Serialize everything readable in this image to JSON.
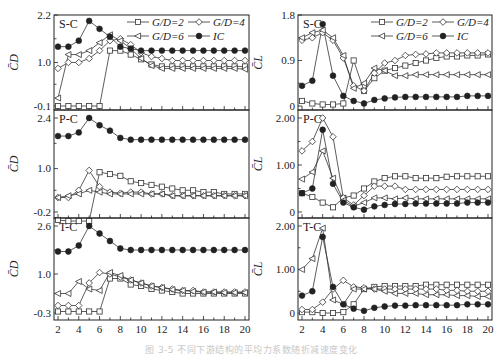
{
  "caption": "图 3-5  不同下游结构的平均力系数随折减速度变化",
  "legend": [
    {
      "label": "G/D=2",
      "marker": "square-open"
    },
    {
      "label": "G/D=4",
      "marker": "diamond-open"
    },
    {
      "label": "G/D=6",
      "marker": "triangle-left-open"
    },
    {
      "label": "IC",
      "marker": "circle-filled"
    }
  ],
  "colors": {
    "line": "#333333",
    "axis": "#222222",
    "text": "#222222"
  },
  "chart_data": [
    {
      "type": "line",
      "panel": "S-C",
      "column": "left",
      "ylabel": "C̄D",
      "xlabel": "Ur",
      "ylim": [
        -0.1,
        2.2
      ],
      "yticks": [
        -0.1,
        1.0,
        2.2
      ],
      "x": [
        2,
        3,
        4,
        5,
        6,
        7,
        8,
        9,
        10,
        11,
        12,
        13,
        14,
        15,
        16,
        17,
        18,
        19,
        20
      ],
      "series": [
        {
          "name": "G/D=2",
          "values": [
            -0.1,
            -0.1,
            -0.1,
            -0.1,
            -0.1,
            1.3,
            1.3,
            1.2,
            1.08,
            0.95,
            0.9,
            0.9,
            0.9,
            0.9,
            0.9,
            0.9,
            0.9,
            0.9,
            0.9
          ]
        },
        {
          "name": "G/D=4",
          "values": [
            0.85,
            1.0,
            1.0,
            1.1,
            1.3,
            1.55,
            1.6,
            1.45,
            1.25,
            1.15,
            1.1,
            1.05,
            1.05,
            1.05,
            1.05,
            1.05,
            1.05,
            1.05,
            1.05
          ]
        },
        {
          "name": "G/D=6",
          "values": [
            0.1,
            1.2,
            1.2,
            1.3,
            1.5,
            1.7,
            1.55,
            1.35,
            1.1,
            0.92,
            0.85,
            0.85,
            0.85,
            0.85,
            0.85,
            0.85,
            0.85,
            0.85,
            0.83
          ]
        },
        {
          "name": "IC",
          "values": [
            1.4,
            1.4,
            1.55,
            2.05,
            1.85,
            1.65,
            1.4,
            1.35,
            1.3,
            1.3,
            1.3,
            1.3,
            1.3,
            1.3,
            1.3,
            1.3,
            1.3,
            1.3,
            1.3
          ]
        }
      ]
    },
    {
      "type": "line",
      "panel": "P-C",
      "column": "left",
      "ylabel": "C̄D",
      "xlabel": "Ur",
      "ylim": [
        -0.2,
        2.4
      ],
      "yticks": [
        -0.2,
        1.0,
        2.4
      ],
      "x": [
        2,
        3,
        4,
        5,
        6,
        7,
        8,
        9,
        10,
        11,
        12,
        13,
        14,
        15,
        16,
        17,
        18,
        19,
        20
      ],
      "series": [
        {
          "name": "G/D=2",
          "values": [
            -0.42,
            -0.45,
            -0.45,
            -0.45,
            0.9,
            0.85,
            0.8,
            0.65,
            0.6,
            0.55,
            0.5,
            0.45,
            0.4,
            0.4,
            0.35,
            0.35,
            0.3,
            0.3,
            0.3
          ]
        },
        {
          "name": "G/D=4",
          "values": [
            0.2,
            0.2,
            0.4,
            0.95,
            0.5,
            0.35,
            0.32,
            0.35,
            0.35,
            0.3,
            0.3,
            0.25,
            0.25,
            0.25,
            0.25,
            0.25,
            0.25,
            0.25,
            0.25
          ]
        },
        {
          "name": "G/D=6",
          "values": [
            0.2,
            0.25,
            0.3,
            0.4,
            0.35,
            0.3,
            0.3,
            0.3,
            0.3,
            0.3,
            0.3,
            0.25,
            0.25,
            0.25,
            0.25,
            0.25,
            0.25,
            0.25,
            0.25
          ]
        },
        {
          "name": "IC",
          "values": [
            1.9,
            1.9,
            2.0,
            2.4,
            2.2,
            2.05,
            1.85,
            1.8,
            1.8,
            1.8,
            1.8,
            1.8,
            1.8,
            1.8,
            1.8,
            1.8,
            1.8,
            1.8,
            1.8
          ]
        }
      ]
    },
    {
      "type": "line",
      "panel": "T-C",
      "column": "left",
      "ylabel": "C̄D",
      "xlabel": "Ur",
      "ylim": [
        -0.3,
        2.6
      ],
      "yticks": [
        -0.3,
        1.0,
        2.6
      ],
      "xticks": [
        2,
        4,
        6,
        8,
        10,
        12,
        14,
        16,
        18,
        20
      ],
      "x": [
        2,
        3,
        4,
        5,
        6,
        7,
        8,
        9,
        10,
        11,
        12,
        13,
        14,
        15,
        16,
        17,
        18,
        19,
        20
      ],
      "series": [
        {
          "name": "G/D=2",
          "values": [
            -0.25,
            -0.25,
            -0.25,
            -0.25,
            -0.25,
            0.85,
            0.85,
            0.65,
            0.6,
            0.5,
            0.45,
            0.4,
            0.35,
            0.35,
            0.35,
            0.35,
            0.35,
            0.35,
            0.35
          ]
        },
        {
          "name": "G/D=4",
          "values": [
            -0.05,
            -0.05,
            -0.05,
            0.7,
            1.05,
            1.0,
            0.9,
            0.8,
            0.7,
            0.6,
            0.55,
            0.5,
            0.45,
            0.45,
            0.4,
            0.4,
            0.4,
            0.4,
            0.4
          ]
        },
        {
          "name": "G/D=6",
          "values": [
            0.35,
            0.35,
            0.75,
            0.5,
            0.45,
            1.05,
            0.95,
            0.8,
            0.7,
            0.6,
            0.55,
            0.48,
            0.45,
            0.42,
            0.4,
            0.4,
            0.38,
            0.38,
            0.38
          ]
        },
        {
          "name": "IC",
          "values": [
            1.75,
            1.75,
            1.95,
            2.6,
            2.35,
            2.1,
            1.85,
            1.8,
            1.8,
            1.8,
            1.8,
            1.8,
            1.8,
            1.8,
            1.8,
            1.8,
            1.8,
            1.8,
            1.8
          ]
        }
      ]
    },
    {
      "type": "line",
      "panel": "S-C",
      "column": "right",
      "ylabel": "C̄L",
      "xlabel": "Ur",
      "ylim": [
        0,
        1.8
      ],
      "yticks": [
        0,
        0.9,
        1.8
      ],
      "x": [
        2,
        3,
        4,
        5,
        6,
        7,
        8,
        9,
        10,
        11,
        12,
        13,
        14,
        15,
        16,
        17,
        18,
        19,
        20
      ],
      "series": [
        {
          "name": "G/D=2",
          "values": [
            0.1,
            0.05,
            0.03,
            0.03,
            0.05,
            0.9,
            0.3,
            0.55,
            0.7,
            0.75,
            0.8,
            0.85,
            0.9,
            0.95,
            0.98,
            0.98,
            1.0,
            1.0,
            1.02
          ]
        },
        {
          "name": "G/D=4",
          "values": [
            1.3,
            1.35,
            1.45,
            1.3,
            0.95,
            0.4,
            0.3,
            0.65,
            0.85,
            0.9,
            1.0,
            1.02,
            1.03,
            1.05,
            1.05,
            1.05,
            1.05,
            1.05,
            1.05
          ]
        },
        {
          "name": "G/D=6",
          "values": [
            1.35,
            1.45,
            1.5,
            1.35,
            1.0,
            0.35,
            0.45,
            0.75,
            0.7,
            0.6,
            0.6,
            0.62,
            0.62,
            0.62,
            0.62,
            0.62,
            0.62,
            0.62,
            0.62
          ]
        },
        {
          "name": "IC",
          "values": [
            0.4,
            0.5,
            1.62,
            0.6,
            0.2,
            0.1,
            0.05,
            0.12,
            0.15,
            0.17,
            0.18,
            0.18,
            0.18,
            0.18,
            0.18,
            0.18,
            0.2,
            0.2,
            0.2
          ]
        }
      ]
    },
    {
      "type": "line",
      "panel": "P-C",
      "column": "right",
      "ylabel": "C̄L",
      "xlabel": "Ur",
      "ylim": [
        0,
        2.0
      ],
      "yticks": [
        0,
        1.0,
        2.0
      ],
      "x": [
        2,
        3,
        4,
        5,
        6,
        7,
        8,
        9,
        10,
        11,
        12,
        13,
        14,
        15,
        16,
        17,
        18,
        19,
        20
      ],
      "series": [
        {
          "name": "G/D=2",
          "values": [
            0.4,
            0.32,
            0.2,
            0.1,
            0.3,
            0.35,
            0.5,
            0.65,
            0.72,
            0.76,
            0.76,
            0.72,
            0.72,
            0.72,
            0.75,
            0.76,
            0.76,
            0.76,
            0.76
          ]
        },
        {
          "name": "G/D=4",
          "values": [
            1.3,
            1.5,
            2.0,
            1.6,
            0.3,
            0.15,
            0.35,
            0.55,
            0.55,
            0.55,
            0.48,
            0.48,
            0.48,
            0.48,
            0.48,
            0.48,
            0.48,
            0.48,
            0.48
          ]
        },
        {
          "name": "G/D=6",
          "values": [
            0.7,
            0.85,
            1.3,
            0.72,
            0.25,
            0.12,
            0.2,
            0.3,
            0.3,
            0.28,
            0.3,
            0.28,
            0.28,
            0.28,
            0.28,
            0.28,
            0.28,
            0.28,
            0.28
          ]
        },
        {
          "name": "IC",
          "values": [
            0.4,
            0.5,
            1.75,
            0.6,
            0.2,
            0.1,
            0.05,
            0.12,
            0.15,
            0.17,
            0.17,
            0.18,
            0.18,
            0.18,
            0.18,
            0.18,
            0.2,
            0.2,
            0.2
          ]
        }
      ]
    },
    {
      "type": "line",
      "panel": "T-C",
      "column": "right",
      "ylabel": "C̄L",
      "xlabel": "Ur",
      "ylim": [
        0,
        2.0
      ],
      "yticks": [
        0,
        1.0,
        2.0
      ],
      "xticks": [
        2,
        4,
        6,
        8,
        10,
        12,
        14,
        16,
        18,
        20
      ],
      "x": [
        2,
        3,
        4,
        5,
        6,
        7,
        8,
        9,
        10,
        11,
        12,
        13,
        14,
        15,
        16,
        17,
        18,
        19,
        20
      ],
      "series": [
        {
          "name": "G/D=2",
          "values": [
            0.02,
            0.02,
            0.0,
            0.0,
            0.02,
            0.2,
            0.55,
            0.6,
            0.62,
            0.62,
            0.62,
            0.62,
            0.65,
            0.65,
            0.65,
            0.65,
            0.65,
            0.65,
            0.65
          ]
        },
        {
          "name": "G/D=4",
          "values": [
            0.08,
            0.08,
            0.25,
            0.55,
            0.75,
            0.6,
            0.58,
            0.55,
            0.55,
            0.55,
            0.55,
            0.55,
            0.55,
            0.55,
            0.52,
            0.52,
            0.5,
            0.5,
            0.5
          ]
        },
        {
          "name": "G/D=6",
          "values": [
            1.0,
            1.25,
            1.95,
            0.3,
            0.2,
            0.55,
            0.55,
            0.55,
            0.5,
            0.45,
            0.45,
            0.45,
            0.42,
            0.42,
            0.42,
            0.4,
            0.4,
            0.38,
            0.38
          ]
        },
        {
          "name": "IC",
          "values": [
            0.4,
            0.5,
            1.75,
            0.6,
            0.2,
            0.1,
            0.05,
            0.12,
            0.15,
            0.17,
            0.17,
            0.18,
            0.18,
            0.18,
            0.18,
            0.18,
            0.2,
            0.2,
            0.2
          ]
        }
      ]
    }
  ]
}
